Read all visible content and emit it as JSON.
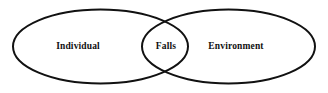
{
  "diagram": {
    "type": "venn-two-set",
    "background_color": "#ffffff",
    "stroke_color": "#111111",
    "stroke_width": 2,
    "width": 328,
    "height": 93,
    "sets": [
      {
        "id": "individual",
        "label": "Individual",
        "role": "left-set",
        "cx": 100.5,
        "cy": 46.5,
        "rx": 87.5,
        "ry": 37
      },
      {
        "id": "environment",
        "label": "Environment",
        "role": "right-set",
        "cx": 228.5,
        "cy": 46.5,
        "rx": 86.5,
        "ry": 37
      }
    ],
    "intersection": {
      "id": "falls",
      "label": "Falls",
      "role": "overlap-region"
    },
    "labels": {
      "left": "Individual",
      "center": "Falls",
      "right": "Environment"
    }
  }
}
